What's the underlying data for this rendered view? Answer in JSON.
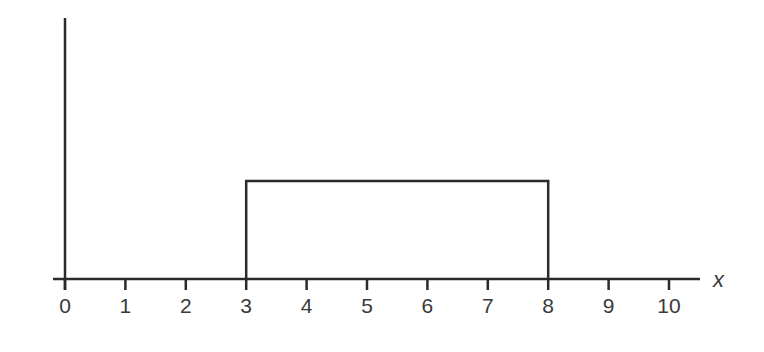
{
  "chart_data": {
    "type": "line",
    "subtype": "uniform-distribution-density",
    "title": "",
    "xlabel": "x",
    "ylabel": "",
    "xlim": [
      0,
      10
    ],
    "x_ticks": [
      0,
      1,
      2,
      3,
      4,
      5,
      6,
      7,
      8,
      9,
      10
    ],
    "x_tick_labels": [
      "0",
      "1",
      "2",
      "3",
      "4",
      "5",
      "6",
      "7",
      "8",
      "9",
      "10"
    ],
    "y_ticks": [],
    "grid": false,
    "legend": null,
    "series": [
      {
        "name": "uniform density",
        "shape": "rectangle",
        "x": [
          3,
          3,
          8,
          8
        ],
        "y": [
          0,
          0.2,
          0.2,
          0
        ],
        "x_min": 3,
        "x_max": 8,
        "height": 0.2
      }
    ],
    "colors": {
      "line": "#2a2a2a",
      "text": "#3a3a3a",
      "background": "#ffffff"
    }
  }
}
